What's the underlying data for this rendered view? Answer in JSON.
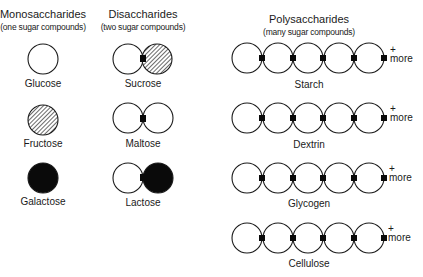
{
  "columns": {
    "mono": {
      "title": "Monosaccharides",
      "subtitle": "(one sugar compounds)"
    },
    "di": {
      "title": "Disaccharides",
      "subtitle": "(two sugar compounds)"
    },
    "poly": {
      "title": "Polysaccharides",
      "subtitle": "(many sugar compounds)"
    }
  },
  "mono": [
    {
      "label": "Glucose",
      "fill": "white"
    },
    {
      "label": "Fructose",
      "fill": "hatched"
    },
    {
      "label": "Galactose",
      "fill": "black"
    }
  ],
  "di": [
    {
      "label": "Sucrose",
      "left": "white",
      "right": "hatched"
    },
    {
      "label": "Maltose",
      "left": "white",
      "right": "white"
    },
    {
      "label": "Lactose",
      "left": "white",
      "right": "black"
    }
  ],
  "poly": [
    {
      "label": "Starch",
      "units": 5,
      "more_plus": "+",
      "more_text": "more"
    },
    {
      "label": "Dextrin",
      "units": 5,
      "more_plus": "+",
      "more_text": "more"
    },
    {
      "label": "Glycogen",
      "units": 5,
      "more_plus": "+",
      "more_text": "more"
    },
    {
      "label": "Cellulose",
      "units": 5,
      "more_plus": "+",
      "more_text": "more"
    }
  ],
  "colors": {
    "stroke": "#1a1a1a",
    "black_fill": "#0a0a0a",
    "background": "#ffffff"
  }
}
